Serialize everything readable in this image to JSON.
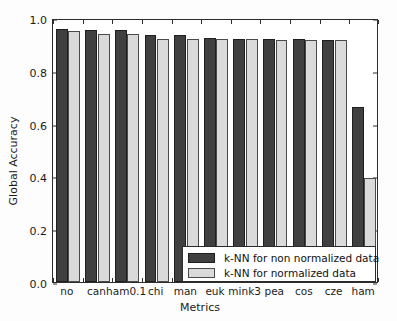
{
  "chart_data": {
    "type": "bar",
    "title": "",
    "xlabel": "Metrics",
    "ylabel": "Global Accuracy",
    "categories": [
      "no",
      "can",
      "ham0.1",
      "chi",
      "man",
      "euk",
      "mink3",
      "pea",
      "cos",
      "cze",
      "ham"
    ],
    "ylim": [
      0.0,
      1.0
    ],
    "yticks": [
      "0.0",
      "0.2",
      "0.4",
      "0.6",
      "0.8",
      "1.0"
    ],
    "ytick_values": [
      0.0,
      0.2,
      0.4,
      0.6,
      0.8,
      1.0
    ],
    "grid": false,
    "legend_position": "lower right",
    "series": [
      {
        "name": "k-NN for non normalized data",
        "color": "#404040",
        "values": [
          0.957,
          0.955,
          0.955,
          0.937,
          0.934,
          0.925,
          0.922,
          0.92,
          0.919,
          0.918,
          0.664
        ]
      },
      {
        "name": "k-NN for normalized data",
        "color": "#dadada",
        "values": [
          0.951,
          0.938,
          0.94,
          0.92,
          0.922,
          0.92,
          0.919,
          0.918,
          0.918,
          0.917,
          0.395
        ]
      }
    ]
  },
  "legend": {
    "entries": [
      {
        "label": "k-NN for non normalized data"
      },
      {
        "label": "k-NN for normalized data"
      }
    ]
  }
}
